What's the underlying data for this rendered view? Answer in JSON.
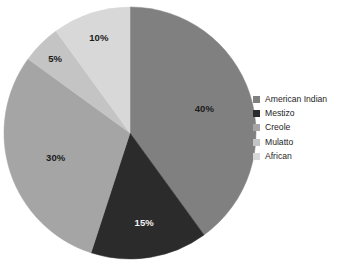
{
  "chart_data": {
    "type": "pie",
    "title": "",
    "subtitle": "",
    "xlabel": "",
    "ylabel": "",
    "categories": [
      "American Indian",
      "Mestizo",
      "Creole",
      "Mulatto",
      "African"
    ],
    "values": [
      40,
      15,
      30,
      5,
      10
    ],
    "value_labels": [
      "40%",
      "15%",
      "30%",
      "5%",
      "10%"
    ],
    "colors": [
      "#808080",
      "#2b2b2b",
      "#a5a5a5",
      "#c4c4c4",
      "#d8d8d8"
    ],
    "label_text_colors": [
      "#1b1b1b",
      "#f2f2f2",
      "#1b1b1b",
      "#1b1b1b",
      "#1b1b1b"
    ],
    "start_angle_deg": 0,
    "direction": "clockwise",
    "grid": false,
    "legend_position": "right",
    "background": "#ffffff"
  },
  "legend": {
    "items": [
      {
        "label": "American Indian",
        "color": "#808080"
      },
      {
        "label": "Mestizo",
        "color": "#2b2b2b"
      },
      {
        "label": "Creole",
        "color": "#a5a5a5"
      },
      {
        "label": "Mulatto",
        "color": "#c4c4c4"
      },
      {
        "label": "African",
        "color": "#d8d8d8"
      }
    ]
  },
  "pie": {
    "slices": [
      {
        "name": "American Indian",
        "percent_label": "40%",
        "value": 40,
        "color": "#808080",
        "label_color": "#1b1b1b"
      },
      {
        "name": "Mestizo",
        "percent_label": "15%",
        "value": 15,
        "color": "#2b2b2b",
        "label_color": "#f2f2f2"
      },
      {
        "name": "Creole",
        "percent_label": "30%",
        "value": 30,
        "color": "#a5a5a5",
        "label_color": "#1b1b1b"
      },
      {
        "name": "Mulatto",
        "percent_label": "5%",
        "value": 5,
        "color": "#c4c4c4",
        "label_color": "#1b1b1b"
      },
      {
        "name": "African",
        "percent_label": "10%",
        "value": 10,
        "color": "#d8d8d8",
        "label_color": "#1b1b1b"
      }
    ]
  }
}
